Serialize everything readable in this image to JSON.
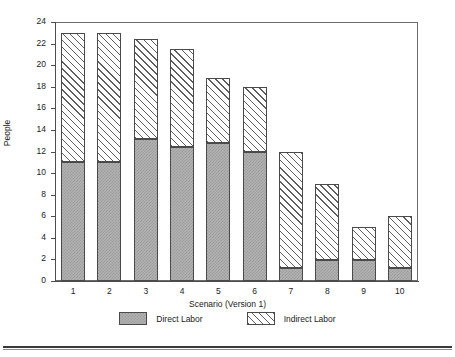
{
  "chart_data": {
    "type": "bar",
    "subtype": "stacked-vertical",
    "title": "",
    "xlabel": "Scenario (Version 1)",
    "ylabel": "People",
    "categories": [
      "1",
      "2",
      "3",
      "4",
      "5",
      "6",
      "7",
      "8",
      "9",
      "10"
    ],
    "ylim": [
      0,
      24
    ],
    "ytick_labels": [
      "0",
      "2",
      "4",
      "6",
      "8",
      "10",
      "12",
      "14",
      "16",
      "18",
      "20",
      "22",
      "24"
    ],
    "ytick_values": [
      0,
      2,
      4,
      6,
      8,
      10,
      12,
      14,
      16,
      18,
      20,
      22,
      24
    ],
    "grid": false,
    "legend_position": "below-axis-center",
    "series": [
      {
        "name": "Direct Labor",
        "pattern": "stipple-grey",
        "color": "#b3b3b3",
        "values": [
          11,
          11,
          13.2,
          12.4,
          12.8,
          12,
          1.2,
          1.9,
          1.9,
          1.2
        ]
      },
      {
        "name": "Indirect Labor",
        "pattern": "diagonal-hatch",
        "color": "#ffffff",
        "values": [
          12,
          12,
          9.2,
          9.1,
          6,
          6,
          10.8,
          7.1,
          3.1,
          4.8
        ]
      }
    ],
    "totals": [
      23,
      23,
      22.4,
      21.5,
      18.8,
      18,
      12,
      9,
      5,
      6
    ]
  },
  "legend": {
    "items": [
      {
        "label": "Direct Labor",
        "swatch": "stipple-grey-swatch"
      },
      {
        "label": "Indirect Labor",
        "swatch": "diagonal-hatch-swatch"
      }
    ]
  },
  "axes": {
    "y_label": "People",
    "x_label": "Scenario (Version 1)"
  }
}
